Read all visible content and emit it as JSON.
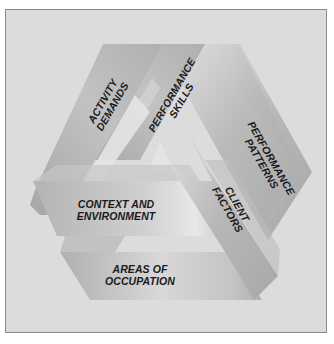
{
  "diagram": {
    "type": "impossible-triangle-framework",
    "colors": {
      "background": "#dcdcdc",
      "frame_border": "#8a8a8a",
      "band_dark": "#a9a9a9",
      "band_light": "#e6e6e6",
      "text": "#1a1a1a"
    },
    "labels": {
      "activity_demands": [
        "ACTIVITY",
        "DEMANDS"
      ],
      "performance_skills": [
        "PERFORMANCE",
        "SKILLS"
      ],
      "performance_patterns": [
        "PERFORMANCE",
        "PATTERNS"
      ],
      "context_environment": [
        "CONTEXT AND",
        "ENVIRONMENT"
      ],
      "client_factors": [
        "CLIENT",
        "FACTORS"
      ],
      "areas_of_occupation": [
        "AREAS OF",
        "OCCUPATION"
      ]
    }
  }
}
